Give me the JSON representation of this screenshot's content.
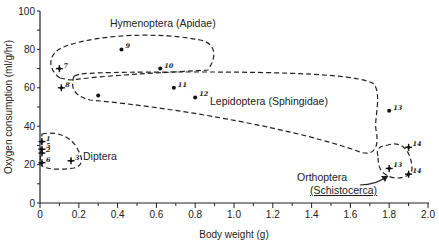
{
  "chart_data": {
    "type": "scatter",
    "title": "",
    "xlabel": "Body weight (g)",
    "ylabel": "Oxygen consumption (ml/g/hr)",
    "xlim": [
      0,
      2.0
    ],
    "ylim": [
      0,
      100
    ],
    "xticks": [
      "0",
      "0.2",
      "0.4",
      "0.6",
      "0.8",
      "1.0",
      "1.2",
      "1.4",
      "1.6",
      "1.8",
      "2.0"
    ],
    "yticks": [
      "0",
      "20",
      "40",
      "60",
      "80",
      "100"
    ],
    "grid": false,
    "legend": "none; groups labeled directly with dashed enclosures",
    "groups": [
      {
        "name": "Diptera",
        "label": "Diptera",
        "points": [
          {
            "label": "1",
            "x": 0.01,
            "y": 32,
            "marker": "cross"
          },
          {
            "label": "5",
            "x": 0.01,
            "y": 28,
            "marker": "cross"
          },
          {
            "label": "2",
            "x": 0.01,
            "y": 26,
            "marker": "cross"
          },
          {
            "label": "6",
            "x": 0.01,
            "y": 21,
            "marker": "cross"
          },
          {
            "label": "3",
            "x": 0.16,
            "y": 22,
            "marker": "cross"
          }
        ]
      },
      {
        "name": "Hymenoptera (Apidae)",
        "label": "Hymenoptera  (Apidae)",
        "points": [
          {
            "label": "7",
            "x": 0.1,
            "y": 70,
            "marker": "cross"
          },
          {
            "label": "8",
            "x": 0.11,
            "y": 60,
            "marker": "cross"
          },
          {
            "label": "9",
            "x": 0.42,
            "y": 80,
            "marker": "dot"
          },
          {
            "label": "10",
            "x": 0.62,
            "y": 70,
            "marker": "dot"
          }
        ]
      },
      {
        "name": "Lepidoptera (Sphingidae)",
        "label": "Lepidoptera  (Sphingidae)",
        "points": [
          {
            "label": "",
            "x": 0.3,
            "y": 56,
            "marker": "dot"
          },
          {
            "label": "11",
            "x": 0.69,
            "y": 60,
            "marker": "dot"
          },
          {
            "label": "12",
            "x": 0.8,
            "y": 55,
            "marker": "dot"
          },
          {
            "label": "13",
            "x": 1.8,
            "y": 48,
            "marker": "dot"
          }
        ]
      },
      {
        "name": "Orthoptera (Schistocerca)",
        "label": "Orthoptera",
        "label_sub": "(Schistocerca)",
        "points": [
          {
            "label": "13",
            "x": 1.8,
            "y": 18,
            "marker": "cross"
          },
          {
            "label": "14",
            "x": 1.9,
            "y": 29,
            "marker": "cross"
          },
          {
            "label": "14",
            "x": 1.9,
            "y": 15,
            "marker": "cross"
          }
        ]
      }
    ]
  }
}
